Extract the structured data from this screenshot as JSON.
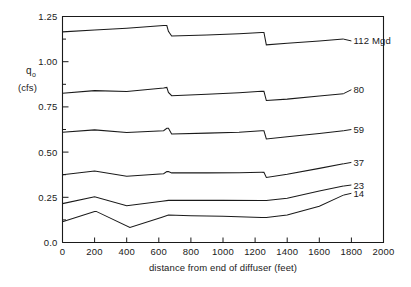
{
  "chart_data": {
    "type": "line",
    "title": "",
    "xlabel": "distance from end of diffuser (feet)",
    "ylabel": "qₒ (cfs)",
    "ylabel_main": "q",
    "ylabel_sub": "o",
    "ylabel_units": "(cfs)",
    "xlim": [
      0,
      2000
    ],
    "ylim": [
      0.0,
      1.25
    ],
    "grid": false,
    "legend_position": "right-inline-labels",
    "xticks": [
      0,
      200,
      400,
      600,
      800,
      1000,
      1200,
      1400,
      1600,
      1800,
      2000
    ],
    "xticklabels": [
      "0",
      "200",
      "400",
      "600",
      "800",
      "1000",
      "1200",
      "1400",
      "1600",
      "1800",
      "2000"
    ],
    "yticks": [
      0.0,
      0.25,
      0.5,
      0.75,
      1.0,
      1.25
    ],
    "yticklabels": [
      "0.0",
      "0.25",
      "0.50",
      "0.75",
      "1.00",
      "1.25"
    ],
    "y_minor_ticks": [
      0.125,
      0.375,
      0.625,
      0.875,
      1.125
    ],
    "series": [
      {
        "name": "112 Mgd",
        "label": "112 Mgd",
        "label_y": 1.115,
        "x": [
          0,
          200,
          400,
          630,
          650,
          660,
          680,
          900,
          1100,
          1240,
          1255,
          1270,
          1400,
          1600,
          1750
        ],
        "values": [
          1.165,
          1.175,
          1.185,
          1.2,
          1.2,
          1.168,
          1.142,
          1.148,
          1.155,
          1.162,
          1.162,
          1.093,
          1.102,
          1.115,
          1.125
        ]
      },
      {
        "name": "80",
        "label": "80",
        "label_y": 0.845,
        "x": [
          0,
          200,
          400,
          630,
          650,
          660,
          680,
          900,
          1100,
          1240,
          1255,
          1270,
          1400,
          1600,
          1750
        ],
        "values": [
          0.825,
          0.84,
          0.835,
          0.855,
          0.858,
          0.83,
          0.812,
          0.82,
          0.828,
          0.836,
          0.836,
          0.785,
          0.793,
          0.81,
          0.823
        ]
      },
      {
        "name": "59",
        "label": "59",
        "label_y": 0.625,
        "x": [
          0,
          200,
          400,
          630,
          650,
          660,
          680,
          900,
          1100,
          1240,
          1255,
          1270,
          1400,
          1600,
          1750
        ],
        "values": [
          0.61,
          0.623,
          0.608,
          0.618,
          0.632,
          0.632,
          0.6,
          0.605,
          0.61,
          0.618,
          0.618,
          0.573,
          0.585,
          0.603,
          0.618
        ]
      },
      {
        "name": "37",
        "label": "37",
        "label_y": 0.443,
        "x": [
          0,
          200,
          400,
          630,
          650,
          660,
          680,
          900,
          1100,
          1240,
          1255,
          1270,
          1400,
          1600,
          1750
        ],
        "values": [
          0.375,
          0.395,
          0.367,
          0.38,
          0.392,
          0.392,
          0.385,
          0.385,
          0.386,
          0.388,
          0.388,
          0.36,
          0.378,
          0.41,
          0.435
        ]
      },
      {
        "name": "23",
        "label": "23",
        "label_y": 0.318,
        "x": [
          0,
          200,
          400,
          620,
          660,
          800,
          1000,
          1240,
          1270,
          1400,
          1600,
          1750
        ],
        "values": [
          0.215,
          0.253,
          0.203,
          0.228,
          0.233,
          0.233,
          0.233,
          0.232,
          0.232,
          0.245,
          0.285,
          0.312
        ]
      },
      {
        "name": "14",
        "label": "14",
        "label_y": 0.272,
        "x": [
          0,
          200,
          210,
          420,
          620,
          660,
          800,
          1000,
          1240,
          1270,
          1400,
          1600,
          1750
        ],
        "values": [
          0.115,
          0.172,
          0.172,
          0.083,
          0.14,
          0.152,
          0.148,
          0.145,
          0.138,
          0.138,
          0.152,
          0.2,
          0.262
        ]
      }
    ]
  },
  "figure": {
    "background_color": "#ffffff",
    "line_color": "#1a1a1a",
    "axis_color": "#1a1a1a"
  }
}
